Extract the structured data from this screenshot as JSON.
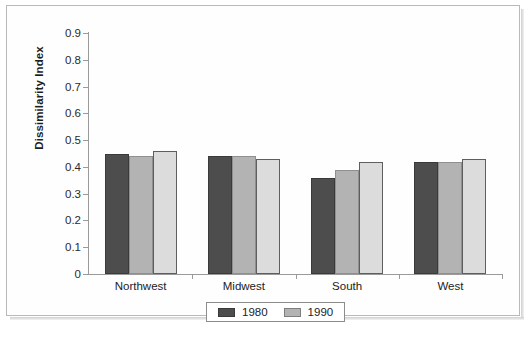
{
  "chart_data": {
    "type": "bar",
    "title": "",
    "xlabel": "",
    "ylabel": "Dissimilarity Index",
    "categories": [
      "Northwest",
      "Midwest",
      "South",
      "West"
    ],
    "series": [
      {
        "name": "1980",
        "color": "#4d4d4d",
        "values": [
          0.45,
          0.44,
          0.36,
          0.42
        ]
      },
      {
        "name": "1990",
        "color": "#b3b3b3",
        "values": [
          0.44,
          0.44,
          0.39,
          0.42
        ]
      },
      {
        "name": "2000",
        "color": "#dcdcdc",
        "values": [
          0.46,
          0.43,
          0.42,
          0.43
        ]
      }
    ],
    "ylim": [
      0,
      0.9
    ],
    "ytick_labels": [
      "0.9",
      "0.8",
      "0.7",
      "0.6",
      "0.5",
      "0.4",
      "0.3",
      "0.2",
      "0.1",
      "0"
    ],
    "ytick_values": [
      0.9,
      0.8,
      0.7,
      0.6,
      0.5,
      0.4,
      0.3,
      0.2,
      0.1,
      0
    ],
    "grid": false,
    "legend_position": "bottom",
    "legend_entries": [
      {
        "label": "1980",
        "color": "#4d4d4d"
      },
      {
        "label": "1990",
        "color": "#b3b3b3"
      }
    ]
  }
}
